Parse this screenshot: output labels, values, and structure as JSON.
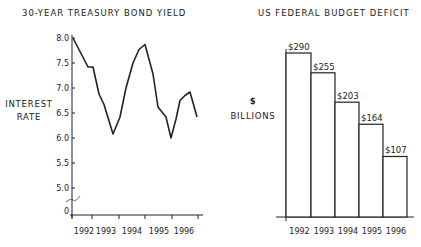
{
  "chart_data": [
    {
      "type": "line",
      "title": "30-YEAR TREASURY BOND YIELD",
      "xlabel": "",
      "ylabel": "INTEREST RATE",
      "ylabel_lines": [
        "INTEREST",
        "RATE"
      ],
      "y_ticks": [
        "8.0",
        "7.5",
        "7.0",
        "6.5",
        "6.0",
        "5.5",
        "5.0",
        "0"
      ],
      "x_ticks": [
        "1992",
        "1993",
        "1994",
        "1995",
        "1996"
      ],
      "ylim": [
        5.0,
        8.0
      ],
      "axis_break": true,
      "grid": false,
      "x": [
        1992.0,
        1992.25,
        1992.35,
        1992.5,
        1992.7,
        1993.0,
        1993.25,
        1993.5,
        1993.75,
        1994.0,
        1994.2,
        1994.5,
        1994.7,
        1995.0,
        1995.2,
        1995.4,
        1995.55,
        1995.75,
        1995.9,
        1996.15
      ],
      "values": [
        8.0,
        7.42,
        7.42,
        6.88,
        6.67,
        6.08,
        6.42,
        7.0,
        7.5,
        7.77,
        7.87,
        7.28,
        6.62,
        6.42,
        6.0,
        6.38,
        6.75,
        6.85,
        6.92,
        6.42
      ]
    },
    {
      "type": "bar",
      "title": "US FEDERAL BUDGET DEFICIT",
      "xlabel": "",
      "ylabel": "$ BILLIONS",
      "ylabel_lines": [
        "$",
        "BILLIONS"
      ],
      "categories": [
        "1992",
        "1993",
        "1994",
        "1995",
        "1996"
      ],
      "values": [
        290,
        255,
        203,
        164,
        107
      ],
      "data_labels": [
        "$290",
        "$255",
        "$203",
        "$164",
        "$107"
      ],
      "grid": false
    }
  ]
}
